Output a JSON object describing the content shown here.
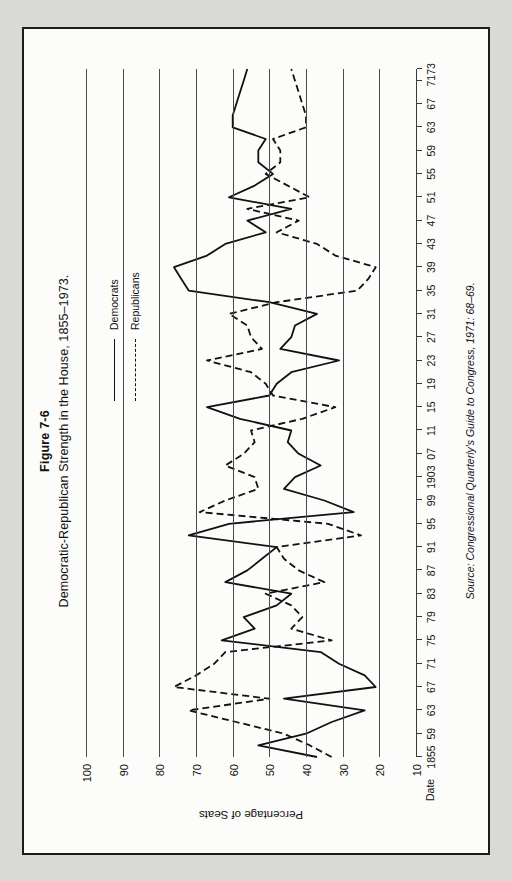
{
  "figure": {
    "number": "Figure 7-6",
    "title": "Democratic-Republican Strength in the House, 1855–1973.",
    "source": "Source: Congressional Quarterly's Guide to Congress, 1971: 68–69."
  },
  "axes": {
    "x_name": "Date",
    "y_title": "Percentage of Seats",
    "y_ticks": [
      "100",
      "90",
      "80",
      "70",
      "60",
      "50",
      "40",
      "30",
      "20",
      "10"
    ],
    "x_ticks": [
      "1855",
      "59",
      "63",
      "67",
      "71",
      "75",
      "79",
      "83",
      "87",
      "91",
      "95",
      "99",
      "1903",
      "07",
      "11",
      "15",
      "19",
      "23",
      "27",
      "31",
      "35",
      "39",
      "43",
      "47",
      "51",
      "55",
      "59",
      "63",
      "67",
      "71",
      "73"
    ]
  },
  "legend": {
    "position": "upper-right",
    "entries": [
      {
        "label": "Democrats",
        "style": "solid"
      },
      {
        "label": "Republicans",
        "style": "dashed"
      }
    ]
  },
  "colors": {
    "ink": "#111111",
    "grid": "#4a4a4a",
    "paper": "#fcfcfa",
    "page": "#d9d9d5"
  },
  "chart_data": {
    "type": "line",
    "title": "Democratic-Republican Strength in the House, 1855–1973.",
    "xlabel": "Date",
    "ylabel": "Percentage of Seats",
    "ylim": [
      10,
      100
    ],
    "grid": true,
    "legend_position": "upper-right",
    "note": "Chart is printed rotated 90° on the page; x axis runs bottom-to-top in the source image.",
    "x": [
      1855,
      1857,
      1859,
      1861,
      1863,
      1865,
      1867,
      1869,
      1871,
      1873,
      1875,
      1877,
      1879,
      1881,
      1883,
      1885,
      1887,
      1889,
      1891,
      1893,
      1895,
      1897,
      1899,
      1901,
      1903,
      1905,
      1907,
      1909,
      1911,
      1913,
      1915,
      1917,
      1919,
      1921,
      1923,
      1925,
      1927,
      1929,
      1931,
      1933,
      1935,
      1937,
      1939,
      1941,
      1943,
      1945,
      1947,
      1949,
      1951,
      1953,
      1955,
      1957,
      1959,
      1961,
      1963,
      1965,
      1967,
      1969,
      1971,
      1973
    ],
    "x_tick_labels": [
      "1855",
      "59",
      "63",
      "67",
      "71",
      "75",
      "79",
      "83",
      "87",
      "91",
      "95",
      "99",
      "1903",
      "07",
      "11",
      "15",
      "19",
      "23",
      "27",
      "31",
      "35",
      "39",
      "43",
      "47",
      "51",
      "55",
      "59",
      "63",
      "67",
      "71",
      "73"
    ],
    "series": [
      {
        "name": "Democrats",
        "style": "solid",
        "values": [
          37,
          53,
          40,
          33,
          24,
          46,
          21,
          24,
          31,
          36,
          63,
          54,
          57,
          48,
          44,
          62,
          56,
          52,
          48,
          72,
          61,
          27,
          35,
          46,
          43,
          36,
          42,
          45,
          44,
          58,
          67,
          50,
          48,
          44,
          31,
          47,
          44,
          43,
          37,
          50,
          72,
          74,
          76,
          67,
          62,
          51,
          56,
          44,
          61,
          54,
          49,
          53,
          53,
          51,
          60,
          60,
          59,
          58,
          57,
          56
        ],
        "note": "Solid line. Peaks near 76% (1939) and 72% (1893, 1935); troughs near 21-24% (1865-1869) and 27% (1897)."
      },
      {
        "name": "Republicans",
        "style": "dashed",
        "values": [
          33,
          39,
          46,
          59,
          72,
          50,
          76,
          70,
          65,
          62,
          33,
          44,
          41,
          44,
          51,
          35,
          42,
          46,
          48,
          25,
          34,
          69,
          62,
          53,
          54,
          62,
          57,
          54,
          55,
          41,
          32,
          49,
          51,
          55,
          67,
          52,
          55,
          56,
          61,
          48,
          26,
          23,
          21,
          32,
          37,
          48,
          42,
          56,
          39,
          45,
          51,
          47,
          47,
          49,
          40,
          40,
          41,
          42,
          43,
          44
        ],
        "note": "Dashed line. Peaks near 76% (1867) and 72% (1863); troughs near 21-26% (1935-1939) and 25% (1893)."
      }
    ]
  }
}
